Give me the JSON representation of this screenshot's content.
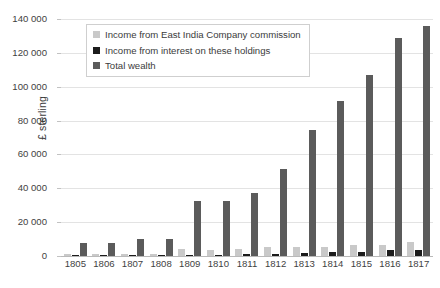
{
  "chart_data": {
    "type": "bar",
    "title": "",
    "subtitle": "",
    "xlabel": "",
    "ylabel": "£ sterling",
    "ylim": [
      0,
      140000
    ],
    "ytick_step": 20000,
    "ytick_labels": [
      "140 000",
      "120 000",
      "100 000",
      "80 000",
      "60 000",
      "40 000",
      "20 000",
      "0"
    ],
    "ytick_values": [
      140000,
      120000,
      100000,
      80000,
      60000,
      40000,
      20000,
      0
    ],
    "grid": true,
    "legend_position": "top-left",
    "categories": [
      "1805",
      "1806",
      "1807",
      "1808",
      "1809",
      "1810",
      "1811",
      "1812",
      "1813",
      "1814",
      "1815",
      "1816",
      "1817"
    ],
    "series": [
      {
        "name": "Income from East India Company commission",
        "color": "#c9c9c9",
        "values": [
          900,
          1000,
          1300,
          1100,
          4000,
          3800,
          4000,
          5200,
          5500,
          5600,
          6300,
          6500,
          8000
        ]
      },
      {
        "name": "Income from interest on these holdings",
        "color": "#1c1c1c",
        "values": [
          300,
          400,
          500,
          500,
          700,
          800,
          1000,
          1200,
          1800,
          2500,
          2600,
          3700,
          3800
        ]
      },
      {
        "name": "Total wealth",
        "color": "#5b5b5b",
        "values": [
          7800,
          7800,
          10000,
          10000,
          32300,
          32400,
          37000,
          51500,
          74500,
          91500,
          107000,
          129000,
          136000
        ]
      }
    ]
  },
  "legend": {
    "items": [
      {
        "label": "Income from East India Company commission",
        "swatch": "commission"
      },
      {
        "label": "Income from interest on these holdings",
        "swatch": "interest"
      },
      {
        "label": "Total wealth",
        "swatch": "total"
      }
    ]
  }
}
